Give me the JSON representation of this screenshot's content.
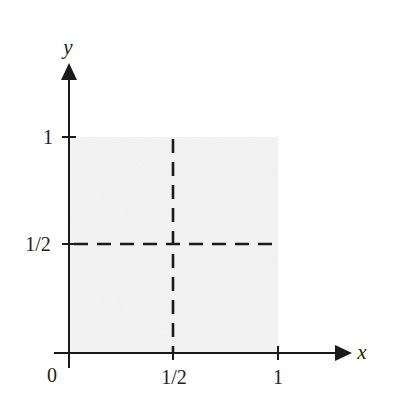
{
  "diagram": {
    "type": "unit-square-partition",
    "axes": {
      "x": {
        "label": "x",
        "ticks": [
          "0",
          "1/2",
          "1"
        ]
      },
      "y": {
        "label": "y",
        "ticks": [
          "1",
          "1/2"
        ]
      }
    },
    "origin_label": "0",
    "shaded_region": {
      "x_range": [
        0,
        1
      ],
      "y_range": [
        0,
        1
      ],
      "fill": "#f0f0f0"
    },
    "dashed_lines": [
      {
        "orientation": "vertical",
        "at": "x = 1/2",
        "from": 0,
        "to": 1
      },
      {
        "orientation": "horizontal",
        "at": "y = 1/2",
        "from": 0,
        "to": 1
      }
    ],
    "colors": {
      "ink": "#1a1a1a",
      "shade": "#f0f0f0",
      "background": "#ffffff"
    }
  }
}
